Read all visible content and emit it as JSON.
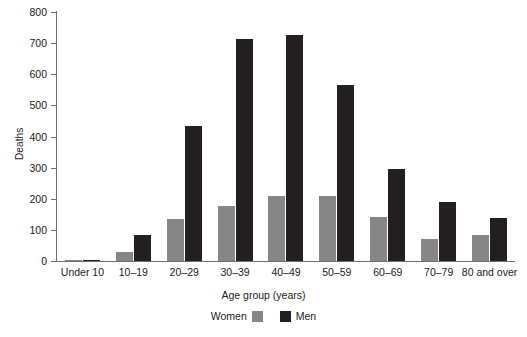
{
  "chart_data": {
    "type": "bar",
    "title": "",
    "subtitle": "",
    "xlabel": "Age group (years)",
    "ylabel": "Deaths",
    "ylim": [
      0,
      800
    ],
    "yticks": [
      0,
      100,
      200,
      300,
      400,
      500,
      600,
      700,
      800
    ],
    "ytick_labels": [
      "0",
      "100",
      "200",
      "300",
      "400",
      "500",
      "600",
      "700",
      "800"
    ],
    "grid": false,
    "legend_position": "bottom-center",
    "categories": [
      "Under 10",
      "10–19",
      "20–29",
      "30–39",
      "40–49",
      "50–59",
      "60–69",
      "70–79",
      "80 and over"
    ],
    "series": [
      {
        "name": "Women",
        "color": "#868686",
        "values": [
          3,
          30,
          135,
          178,
          210,
          210,
          140,
          70,
          85
        ]
      },
      {
        "name": "Men",
        "color": "#231f20",
        "values": [
          4,
          85,
          433,
          713,
          727,
          565,
          295,
          190,
          138
        ]
      }
    ]
  },
  "colors": {
    "women": "#868686",
    "men": "#231f20",
    "axis": "#6e6e6e",
    "text": "#1a1a1a",
    "background": "#ffffff"
  }
}
